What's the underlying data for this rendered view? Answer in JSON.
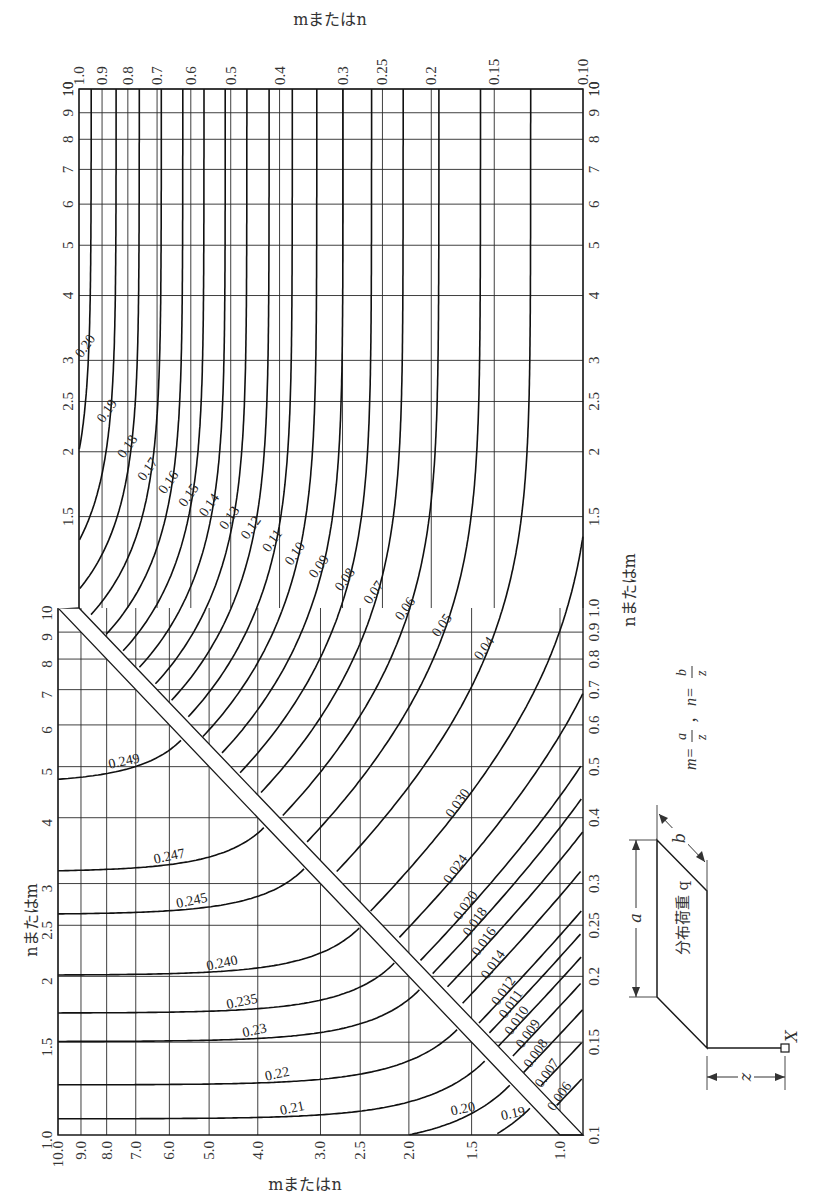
{
  "chart_data": {
    "type": "line",
    "subtype": "contour-nomograph",
    "title": "",
    "formula_label": {
      "m": "m = a/z",
      "n": "n = b/z",
      "text": "m=a/z，n=b/z"
    },
    "upper_panel": {
      "x_axis": {
        "label": "mまたはn",
        "position": "top",
        "scale": "log",
        "range": [
          1.0,
          0.1
        ],
        "ticks": [
          "1.0",
          "0.9",
          "0.8",
          "0.7",
          "0.6",
          "0.5",
          "0.4",
          "0.3",
          "0.25",
          "0.2",
          "0.15",
          "0.10"
        ]
      },
      "y_axis": {
        "label": "",
        "position": "left and right",
        "scale": "log",
        "range": [
          1.0,
          10
        ],
        "ticks": [
          "1.5",
          "2",
          "2.5",
          "3",
          "4",
          "5",
          "6",
          "7",
          "8",
          "9",
          "10"
        ]
      },
      "contour_levels": [
        0.2,
        0.19,
        0.18,
        0.17,
        0.16,
        0.15,
        0.14,
        0.13,
        0.12,
        0.11,
        0.1,
        0.09,
        0.08,
        0.07,
        0.06,
        0.05,
        0.04,
        0.03,
        0.024,
        0.02,
        0.018,
        0.016,
        0.014,
        0.012,
        0.011,
        0.01,
        0.009,
        0.008,
        0.007,
        0.006
      ],
      "labeled_levels": [
        "0.20",
        "0.19",
        "0.18",
        "0.17",
        "0.16",
        "0.15",
        "0.14",
        "0.13",
        "0.12",
        "0.11",
        "0.10",
        "0.09",
        "0.08",
        "0.07",
        "0.06",
        "0.05",
        "0.04",
        "0.030",
        "0.024",
        "0.020",
        "0.018",
        "0.016",
        "0.014",
        "0.012",
        "0.011",
        "0.010",
        "0.009",
        "0.008",
        "0.007",
        "0.006"
      ]
    },
    "lower_panel": {
      "x_axis": {
        "label": "mまたはn",
        "position": "bottom",
        "scale": "log",
        "range": [
          10.0,
          1.0
        ],
        "ticks": [
          "10.0",
          "9.0",
          "8.0",
          "7.0",
          "6.0",
          "5.0",
          "4.0",
          "3.0",
          "2.5",
          "2.0",
          "1.5",
          "1.0"
        ]
      },
      "y_axis": {
        "label": "nまたはm",
        "position": "left",
        "scale": "log",
        "range": [
          1.0,
          10
        ],
        "ticks": [
          "1.0",
          "1.5",
          "2",
          "2.5",
          "3",
          "4",
          "5",
          "6",
          "7",
          "8",
          "9",
          "10"
        ]
      },
      "right_axis": {
        "label": "nまたはm",
        "scale": "log",
        "range": [
          0.1,
          1.0
        ],
        "ticks": [
          "0.1",
          "0.15",
          "0.2",
          "0.25",
          "0.3",
          "0.4",
          "0.5",
          "0.6",
          "0.7",
          "0.8",
          "0.9",
          "1.0"
        ]
      },
      "contour_levels": [
        0.249,
        0.247,
        0.245,
        0.24,
        0.235,
        0.23,
        0.22,
        0.21,
        0.2,
        0.19
      ],
      "labeled_levels": [
        "0.249",
        "0.247",
        "0.245",
        "0.240",
        "0.235",
        "0.23",
        "0.22",
        "0.21",
        "0.20",
        "0.19"
      ]
    },
    "grid": true,
    "legend": null
  },
  "labels": {
    "top_axis_title": "mまたはn",
    "bottom_axis_title": "mまたはn",
    "left_axis_title": "nまたはm",
    "right_axis_title": "nまたはm",
    "formula": "m=a/z，n=b/z",
    "formula_m": "m=",
    "formula_n": "n=",
    "load_label": "分布荷重 q",
    "dim_a": "a",
    "dim_b": "b",
    "dim_z": "z",
    "point_X": "X"
  }
}
